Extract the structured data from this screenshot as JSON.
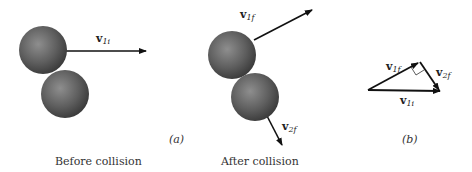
{
  "captions": {
    "before": "Before collision",
    "after": "After collision"
  },
  "panels": {
    "a": "(a)",
    "b": "(b)"
  },
  "vectors": {
    "v1i": {
      "base": "v",
      "sub": "1i"
    },
    "v1f": {
      "base": "v",
      "sub": "1f"
    },
    "v2f": {
      "base": "v",
      "sub": "2f"
    }
  },
  "colors": {
    "ball": "#5a5a5a",
    "ball_highlight": "#8a8a8a",
    "arrow": "#111111"
  }
}
